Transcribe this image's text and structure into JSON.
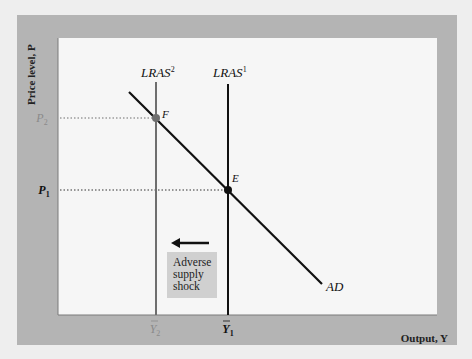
{
  "figure": {
    "y_axis_label": "Price level, P",
    "x_axis_label": "Output, Y",
    "curves": [
      {
        "id": "lras2",
        "label": "LRAS",
        "superscript": "2",
        "color": "#6e6e6e"
      },
      {
        "id": "lras1",
        "label": "LRAS",
        "superscript": "1",
        "color": "#111111"
      },
      {
        "id": "ad",
        "label": "AD",
        "color": "#111111"
      }
    ],
    "points": [
      {
        "id": "F",
        "label": "F",
        "color": "#6e6e6e"
      },
      {
        "id": "E",
        "label": "E",
        "color": "#111111"
      }
    ],
    "y_ticks": [
      {
        "label": "P",
        "subscript": "2",
        "color": "#8a8a8a"
      },
      {
        "label": "P",
        "subscript": "1",
        "color": "#111111"
      }
    ],
    "x_ticks": [
      {
        "label": "Y",
        "subscript": "2",
        "bar": true,
        "color": "#8a8a8a"
      },
      {
        "label": "Y",
        "subscript": "1",
        "bar": true,
        "color": "#111111"
      }
    ],
    "annotation": {
      "lines": [
        "Adverse",
        "supply",
        "shock"
      ],
      "arrow_direction": "left"
    },
    "colors": {
      "frame": "#b4b4b4",
      "plot_bg": "#f6f6f6",
      "shock_box": "#d0d0d0",
      "page_bg": "#eeeeee"
    }
  }
}
